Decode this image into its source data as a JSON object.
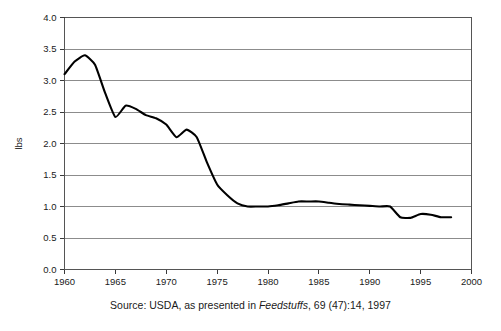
{
  "figure": {
    "caption_prefix": "Source: USDA, as presented in ",
    "caption_italic": "Feedstuffs",
    "caption_suffix": ", 69 (47):14, 1997",
    "faint_header": ""
  },
  "chart_data": {
    "type": "line",
    "title": "",
    "xlabel": "",
    "ylabel": "lbs",
    "xlim": [
      1960,
      2000
    ],
    "ylim": [
      0.0,
      4.0
    ],
    "grid": "horizontal",
    "legend": "none",
    "xticks": [
      1960,
      1965,
      1970,
      1975,
      1980,
      1985,
      1990,
      1995,
      2000
    ],
    "xtick_labels": [
      "1960",
      "1965",
      "1970",
      "1975",
      "1980",
      "1985",
      "1990",
      "1995",
      "2000"
    ],
    "yticks": [
      0.0,
      0.5,
      1.0,
      1.5,
      2.0,
      2.5,
      3.0,
      3.5,
      4.0
    ],
    "ytick_labels": [
      "0.0",
      "0.5",
      "1.0",
      "1.5",
      "2.0",
      "2.5",
      "3.0",
      "3.5",
      "4.0"
    ],
    "series": [
      {
        "name": "lbs",
        "color": "#000000",
        "x": [
          1960,
          1961,
          1962,
          1963,
          1964,
          1965,
          1966,
          1967,
          1968,
          1969,
          1970,
          1971,
          1972,
          1973,
          1974,
          1975,
          1976,
          1977,
          1978,
          1979,
          1980,
          1981,
          1982,
          1983,
          1984,
          1985,
          1986,
          1987,
          1988,
          1989,
          1990,
          1991,
          1992,
          1993,
          1994,
          1995,
          1996,
          1997,
          1998
        ],
        "values": [
          3.1,
          3.3,
          3.4,
          3.25,
          2.8,
          2.42,
          2.6,
          2.55,
          2.45,
          2.4,
          2.3,
          2.1,
          2.22,
          2.1,
          1.7,
          1.35,
          1.18,
          1.05,
          1.0,
          1.0,
          1.0,
          1.02,
          1.05,
          1.08,
          1.08,
          1.08,
          1.06,
          1.04,
          1.03,
          1.02,
          1.01,
          1.0,
          1.0,
          0.83,
          0.82,
          0.88,
          0.87,
          0.83,
          0.83
        ]
      }
    ]
  }
}
